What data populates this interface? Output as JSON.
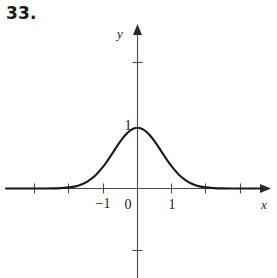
{
  "figure": {
    "exercise_number": "33.",
    "axis_labels": {
      "x": "x",
      "y": "y"
    },
    "tick_labels": {
      "x_neg_one": "−1",
      "origin": "0",
      "x_pos_one": "1",
      "y_one": "1"
    }
  },
  "chart_data": {
    "type": "line",
    "title": "",
    "xlabel": "x",
    "ylabel": "y",
    "xlim": [
      -3.0,
      3.8
    ],
    "ylim": [
      -1.0,
      2.7
    ],
    "grid": false,
    "legend": null,
    "x_ticks": [
      -3,
      -2,
      -1,
      0,
      1,
      2,
      3
    ],
    "x_tick_labels": [
      "",
      "",
      "−1",
      "0",
      "1",
      "",
      ""
    ],
    "y_ticks": [
      -1,
      1,
      2
    ],
    "y_tick_labels": [
      "",
      "1",
      ""
    ],
    "series": [
      {
        "name": "bell curve",
        "function": "y = e^(-x^2)",
        "x": [
          -3.0,
          -2.75,
          -2.5,
          -2.25,
          -2.0,
          -1.75,
          -1.5,
          -1.25,
          -1.0,
          -0.875,
          -0.75,
          -0.625,
          -0.5,
          -0.375,
          -0.25,
          -0.125,
          0.0,
          0.125,
          0.25,
          0.375,
          0.5,
          0.625,
          0.75,
          0.875,
          1.0,
          1.25,
          1.5,
          1.75,
          2.0,
          2.25,
          2.5,
          2.75,
          3.0
        ],
        "y": [
          0.0,
          0.0005,
          0.0019,
          0.0063,
          0.018,
          0.0458,
          0.105,
          0.2096,
          0.3679,
          0.4643,
          0.5698,
          0.6766,
          0.7788,
          0.8688,
          0.9394,
          0.9845,
          1.0,
          0.9845,
          0.9394,
          0.8688,
          0.7788,
          0.6766,
          0.5698,
          0.4643,
          0.3679,
          0.2096,
          0.105,
          0.0458,
          0.018,
          0.0063,
          0.0019,
          0.0005,
          0.0
        ]
      }
    ]
  }
}
